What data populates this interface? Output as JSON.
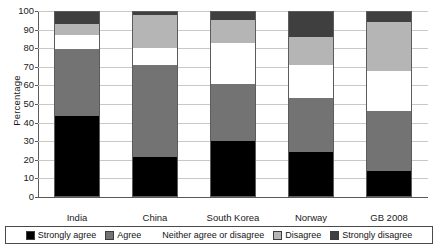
{
  "chart_data": {
    "type": "bar",
    "subtype": "stacked-bar-100",
    "title": "",
    "xlabel": "",
    "ylabel": "Percentage",
    "ylim": [
      0,
      100
    ],
    "yticks": [
      0,
      10,
      20,
      30,
      40,
      50,
      60,
      70,
      80,
      90,
      100
    ],
    "ytick_labels": [
      "0",
      "10",
      "20",
      "30",
      "40",
      "50",
      "60",
      "70",
      "80",
      "90",
      "100"
    ],
    "grid": true,
    "grid_axis": "y",
    "legend_position": "bottom",
    "categories": [
      "India",
      "China",
      "South Korea",
      "Norway",
      "GB 2008"
    ],
    "series": [
      {
        "name": "Strongly agree",
        "color": "#000000",
        "values": [
          43.5,
          21.5,
          30.0,
          24.0,
          14.0
        ]
      },
      {
        "name": "Agree",
        "color": "#737373",
        "values": [
          36.0,
          49.5,
          31.0,
          29.5,
          32.0
        ]
      },
      {
        "name": "Neither agree or disagree",
        "color": "#ffffff",
        "values": [
          7.5,
          9.0,
          22.0,
          17.5,
          22.0
        ]
      },
      {
        "name": "Disagree",
        "color": "#b5b5b5",
        "values": [
          6.0,
          18.0,
          12.0,
          15.0,
          26.0
        ]
      },
      {
        "name": "Strongly disagree",
        "color": "#3f3f3f",
        "values": [
          7.0,
          2.0,
          5.0,
          14.0,
          6.0
        ]
      }
    ],
    "cumulative_tops": {
      "India": [
        43.5,
        79.5,
        87.0,
        93.0,
        100.0
      ],
      "China": [
        21.5,
        71.0,
        80.0,
        98.0,
        100.0
      ],
      "South Korea": [
        30.0,
        61.0,
        83.0,
        95.0,
        100.0
      ],
      "Norway": [
        24.0,
        53.5,
        71.0,
        86.0,
        100.0
      ],
      "GB 2008": [
        14.0,
        46.0,
        68.0,
        94.0,
        100.0
      ]
    }
  },
  "colors": {
    "strongly_agree": "#000000",
    "agree": "#737373",
    "neither": "#ffffff",
    "disagree": "#b5b5b5",
    "strongly_disagree": "#3f3f3f",
    "gridline": "#c8c8c8",
    "axis": "#5a5a5a",
    "bar_outline": "#5c5c5c",
    "text": "#1a1a1a",
    "background": "#ffffff"
  },
  "axes": {
    "y_title": "Percentage"
  },
  "legend": {
    "items": [
      {
        "label": "Strongly agree",
        "color": "#000000"
      },
      {
        "label": "Agree",
        "color": "#737373"
      },
      {
        "label": "Neither agree or disagree",
        "color": "#ffffff"
      },
      {
        "label": "Disagree",
        "color": "#b5b5b5"
      },
      {
        "label": "Strongly disagree",
        "color": "#3f3f3f"
      }
    ]
  }
}
